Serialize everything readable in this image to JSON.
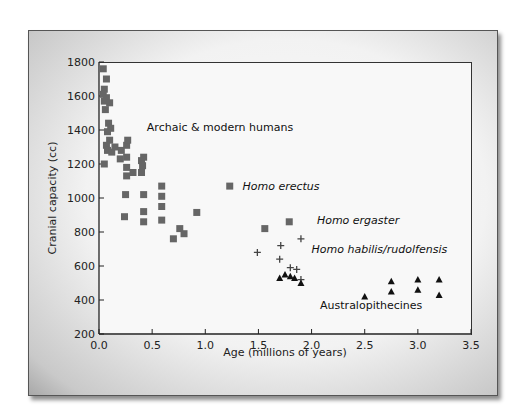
{
  "chart_data": {
    "type": "scatter",
    "title": "",
    "xlabel": "Age (millions of years)",
    "ylabel": "Cranial capacity (cc)",
    "xlim": [
      0.0,
      3.5
    ],
    "ylim": [
      200,
      1800
    ],
    "xticks": [
      "0.0",
      "0.5",
      "1.0",
      "1.5",
      "2.0",
      "2.5",
      "3.0",
      "3.5"
    ],
    "yticks": [
      "200",
      "400",
      "600",
      "800",
      "1000",
      "1200",
      "1400",
      "1600",
      "1800"
    ],
    "grid": false,
    "legend": "none (inline annotations)",
    "series": [
      {
        "name": "Archaic & modern humans",
        "marker": "square",
        "color": "#666666",
        "points": [
          [
            0.04,
            1760
          ],
          [
            0.07,
            1700
          ],
          [
            0.05,
            1640
          ],
          [
            0.04,
            1610
          ],
          [
            0.07,
            1590
          ],
          [
            0.05,
            1570
          ],
          [
            0.1,
            1560
          ],
          [
            0.06,
            1520
          ],
          [
            0.09,
            1440
          ],
          [
            0.11,
            1410
          ],
          [
            0.08,
            1390
          ],
          [
            0.1,
            1340
          ],
          [
            0.07,
            1310
          ],
          [
            0.08,
            1280
          ],
          [
            0.12,
            1270
          ],
          [
            0.15,
            1300
          ],
          [
            0.21,
            1280
          ],
          [
            0.26,
            1310
          ],
          [
            0.27,
            1340
          ],
          [
            0.05,
            1200
          ],
          [
            0.2,
            1230
          ],
          [
            0.26,
            1240
          ],
          [
            0.26,
            1180
          ],
          [
            0.26,
            1130
          ],
          [
            0.32,
            1150
          ],
          [
            0.4,
            1220
          ],
          [
            0.42,
            1240
          ],
          [
            0.41,
            1190
          ],
          [
            0.4,
            1150
          ],
          [
            0.25,
            1020
          ],
          [
            0.42,
            1020
          ],
          [
            0.59,
            1070
          ],
          [
            0.59,
            1010
          ],
          [
            0.59,
            950
          ],
          [
            0.24,
            890
          ],
          [
            0.42,
            920
          ],
          [
            0.42,
            860
          ],
          [
            0.59,
            870
          ],
          [
            0.92,
            915
          ],
          [
            0.76,
            820
          ],
          [
            0.8,
            790
          ],
          [
            0.7,
            760
          ]
        ]
      },
      {
        "name": "Homo erectus",
        "marker": "square",
        "color": "#666666",
        "points": [
          [
            1.23,
            1070
          ]
        ]
      },
      {
        "name": "Homo ergaster",
        "marker": "square",
        "color": "#666666",
        "points": [
          [
            1.56,
            820
          ],
          [
            1.79,
            860
          ]
        ]
      },
      {
        "name": "Homo habilis/rudolfensis",
        "marker": "plus",
        "color": "#444444",
        "points": [
          [
            1.49,
            680
          ],
          [
            1.71,
            720
          ],
          [
            1.9,
            760
          ],
          [
            1.7,
            640
          ],
          [
            1.8,
            590
          ],
          [
            1.86,
            580
          ],
          [
            1.9,
            520
          ]
        ]
      },
      {
        "name": "Australopithecines",
        "marker": "triangle",
        "color": "#111111",
        "points": [
          [
            1.7,
            530
          ],
          [
            1.75,
            550
          ],
          [
            1.8,
            540
          ],
          [
            1.84,
            530
          ],
          [
            1.9,
            500
          ],
          [
            2.5,
            420
          ],
          [
            2.75,
            510
          ],
          [
            2.75,
            450
          ],
          [
            3.0,
            520
          ],
          [
            3.0,
            460
          ],
          [
            3.2,
            520
          ],
          [
            3.2,
            430
          ]
        ]
      }
    ],
    "annotations": [
      {
        "text": "Archaic & modern humans",
        "italic": false,
        "x": 0.45,
        "y": 1420
      },
      {
        "text": "Homo erectus",
        "italic": true,
        "x": 1.35,
        "y": 1070
      },
      {
        "text": "Homo ergaster",
        "italic": true,
        "x": 2.05,
        "y": 870
      },
      {
        "text": "Homo habilis/rudolfensis",
        "italic": true,
        "x": 2.0,
        "y": 700
      },
      {
        "text": "Australopithecines",
        "italic": false,
        "x": 2.08,
        "y": 370
      }
    ]
  },
  "labels": {
    "xlabel": "Age (millions of years)",
    "ylabel": "Cranial capacity (cc)"
  }
}
